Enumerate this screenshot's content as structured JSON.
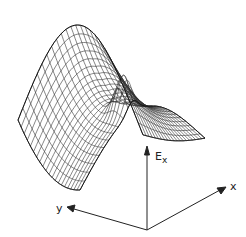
{
  "figure": {
    "axes": {
      "vertical_label": "E",
      "vertical_subscript": "x",
      "x_label": "x",
      "y_label": "y"
    },
    "colors": {
      "line": "#222222",
      "background": "#ffffff"
    }
  }
}
